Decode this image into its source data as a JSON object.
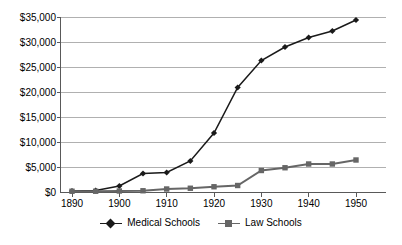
{
  "chart_data": {
    "type": "line",
    "title": "",
    "xlabel": "",
    "ylabel": "",
    "x": [
      1890,
      1895,
      1900,
      1905,
      1910,
      1915,
      1920,
      1925,
      1930,
      1935,
      1940,
      1945,
      1950
    ],
    "xlim": [
      1890,
      1950
    ],
    "ylim": [
      0,
      35000
    ],
    "ytick_values": [
      0,
      5000,
      10000,
      15000,
      20000,
      25000,
      30000,
      35000
    ],
    "ytick_labels": [
      "$0",
      "$5,000",
      "$10,000",
      "$15,000",
      "$20,000",
      "$25,000",
      "$30,000",
      "$35,000"
    ],
    "xtick_values": [
      1890,
      1900,
      1910,
      1920,
      1930,
      1940,
      1950
    ],
    "xtick_labels": [
      "1890",
      "1900",
      "1910",
      "1920",
      "1930",
      "1940",
      "1950"
    ],
    "grid": "horizontal",
    "legend_position": "bottom",
    "series": [
      {
        "name": "Medical Schools",
        "marker": "diamond",
        "color": "#1a1a1a",
        "values": [
          300,
          400,
          1300,
          3800,
          4000,
          6300,
          11900,
          21000,
          26400,
          29100,
          31000,
          32300,
          34500
        ]
      },
      {
        "name": "Law Schools",
        "marker": "square",
        "color": "#666666",
        "values": [
          250,
          250,
          300,
          350,
          700,
          850,
          1150,
          1400,
          4400,
          4950,
          5700,
          5700,
          6500
        ]
      }
    ]
  },
  "legend": {
    "items": [
      {
        "label": "Medical Schools"
      },
      {
        "label": "Law Schools"
      }
    ]
  },
  "colors": {
    "medical": "#1a1a1a",
    "law": "#666666",
    "gridline": "#b0b0b0",
    "axis": "#595959",
    "text": "#000000",
    "background": "#ffffff"
  }
}
